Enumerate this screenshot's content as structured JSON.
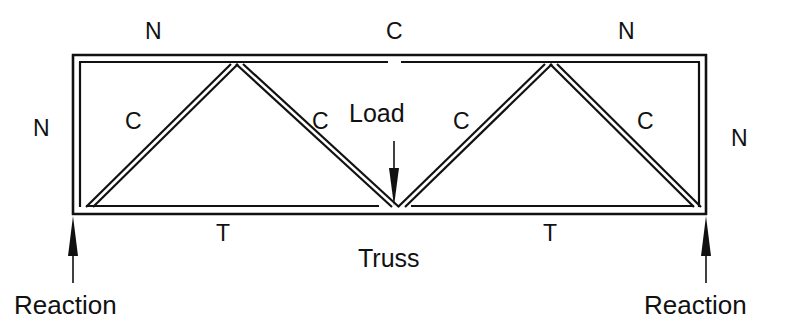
{
  "figure": {
    "title": "Truss",
    "caption_label": "Truss",
    "load_label": "Load",
    "reaction_left_label": "Reaction",
    "reaction_right_label": "Reaction",
    "line_color": "#111111",
    "background_color": "#ffffff"
  },
  "force_labels": {
    "top_chord_left": "N",
    "top_chord_center": "C",
    "top_chord_right": "N",
    "left_vertical": "N",
    "right_vertical": "N",
    "diagonal_1": "C",
    "diagonal_2": "C",
    "diagonal_3": "C",
    "diagonal_4": "C",
    "bottom_chord_left": "T",
    "bottom_chord_right": "T"
  },
  "geometry": {
    "outer_left_x": 72,
    "outer_right_x": 707,
    "outer_top_y": 54,
    "outer_bottom_y": 214,
    "inner_left_x": 79,
    "inner_right_x": 700,
    "inner_top_y": 62,
    "inner_bottom_y": 206,
    "node_top_1_x": 233,
    "node_top_2_x": 548,
    "node_bottom_center_x": 395
  },
  "annotations": {
    "load_arrow_tip_y": 205,
    "load_arrow_start_y": 140,
    "reaction_arrow_tip_y": 214,
    "reaction_arrow_start_y": 285
  }
}
